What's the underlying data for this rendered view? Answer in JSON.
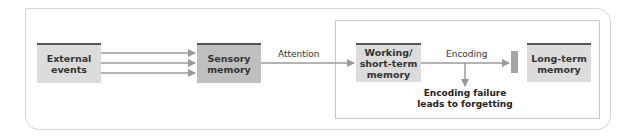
{
  "diagram": {
    "colors": {
      "light_box": "#dcdcdc",
      "dark_box": "#bfbfbf",
      "top_bar": "#555555",
      "arrow": "#9a9a9a",
      "frame": "#d4d4d4"
    },
    "nodes": {
      "external": {
        "line1": "External",
        "line2": "events"
      },
      "sensory": {
        "line1": "Sensory",
        "line2": "memory"
      },
      "working": {
        "line1": "Working/",
        "line2": "short-term",
        "line3": "memory"
      },
      "longterm": {
        "line1": "Long-term",
        "line2": "memory"
      }
    },
    "edges": {
      "attention": "Attention",
      "encoding": "Encoding",
      "failure_line1": "Encoding failure",
      "failure_line2": "leads to forgetting"
    }
  }
}
